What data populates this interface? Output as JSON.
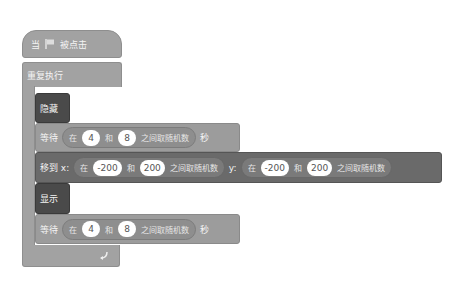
{
  "hat": {
    "prefix": "当",
    "flag_icon": "green-flag-icon",
    "suffix": "被点击"
  },
  "forever": {
    "label": "重复执行",
    "loop_icon": "loop-arrow-icon"
  },
  "hide": {
    "label": "隐藏"
  },
  "wait1": {
    "label": "等待",
    "op_label_in": "在",
    "value1": "4",
    "op_and": "和",
    "value2": "8",
    "op_suffix": "之间取随机数",
    "unit": "秒"
  },
  "goto": {
    "label": "移到 x:",
    "x_op": {
      "in": "在",
      "value1": "-200",
      "and": "和",
      "value2": "200",
      "suffix": "之间取随机数"
    },
    "y_label": "y:",
    "y_op": {
      "in": "在",
      "value1": "-200",
      "and": "和",
      "value2": "200",
      "suffix": "之间取随机数"
    }
  },
  "show": {
    "label": "显示"
  },
  "wait2": {
    "label": "等待",
    "op_label_in": "在",
    "value1": "4",
    "op_and": "和",
    "value2": "8",
    "op_suffix": "之间取随机数",
    "unit": "秒"
  },
  "colors": {
    "control": "#a2a2a2",
    "looks": "#4a4a4a",
    "motion": "#6a6a6a"
  }
}
